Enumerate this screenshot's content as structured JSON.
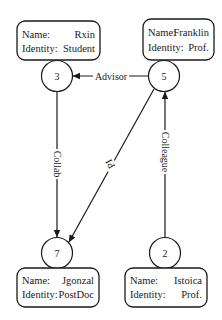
{
  "diagram": {
    "type": "directed-graph",
    "nodes": [
      {
        "id": "3",
        "label": "3",
        "name_key": "Name:",
        "name": "Rxin",
        "identity_key": "Identity:",
        "identity": "Student"
      },
      {
        "id": "5",
        "label": "5",
        "name_key": "Name:",
        "name": "Franklin",
        "identity_key": "Identity:",
        "identity": "Prof."
      },
      {
        "id": "7",
        "label": "7",
        "name_key": "Name:",
        "name": "Jgonzal",
        "identity_key": "Identity:",
        "identity": "PostDoc"
      },
      {
        "id": "2",
        "label": "2",
        "name_key": "Name:",
        "name": "Istoica",
        "identity_key": "Identity:",
        "identity": "Prof."
      }
    ],
    "edges": [
      {
        "from": "5",
        "to": "3",
        "label": "Advisor"
      },
      {
        "from": "3",
        "to": "7",
        "label": "Collab"
      },
      {
        "from": "5",
        "to": "7",
        "label": "PI"
      },
      {
        "from": "2",
        "to": "5",
        "label": "Colleague"
      }
    ],
    "colors": {
      "stroke": "#1a1a1a",
      "background": "#ffffff"
    }
  }
}
